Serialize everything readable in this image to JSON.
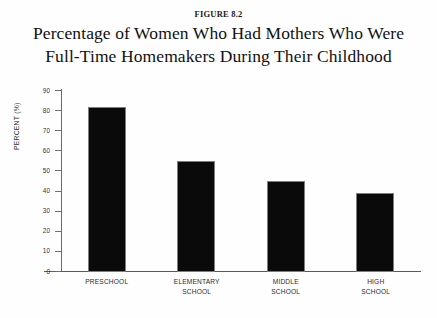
{
  "figure": {
    "number": "FIGURE 8.2",
    "title_line1": "Percentage of Women Who Had Mothers Who Were",
    "title_line2": "Full-Time Homemakers During Their Childhood"
  },
  "chart_data": {
    "type": "bar",
    "title": "Percentage of Women Who Had Mothers Who Were Full-Time Homemakers During Their Childhood",
    "categories": [
      "PRESCHOOL",
      "ELEMENTARY SCHOOL",
      "MIDDLE SCHOOL",
      "HIGH SCHOOL"
    ],
    "category_lines": [
      [
        "PRESCHOOL"
      ],
      [
        "ELEMENTARY",
        "SCHOOL"
      ],
      [
        "MIDDLE",
        "SCHOOL"
      ],
      [
        "HIGH",
        "SCHOOL"
      ]
    ],
    "values": [
      82,
      55,
      45.5,
      39.5
    ],
    "xlabel": "",
    "ylabel": "PERCENT (%)",
    "ylim": [
      0,
      90
    ],
    "ytick_step": 10,
    "yticks": [
      0,
      10,
      20,
      30,
      40,
      50,
      60,
      70,
      80,
      90
    ],
    "ytick_labels": [
      "0",
      "10",
      "20",
      "30",
      "40",
      "50",
      "60",
      "70",
      "80",
      "90"
    ],
    "grid": false,
    "legend": null,
    "bar_color": "#0a0a0a",
    "axis_color": "#6d6d6d",
    "background": "#fefefe"
  }
}
